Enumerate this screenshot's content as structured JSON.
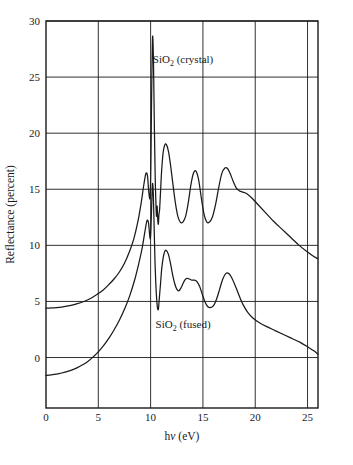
{
  "figure": {
    "background_color": "#ffffff",
    "line_color": "#1a1a1a"
  },
  "axes": {
    "x_title": "hν (eV)",
    "x_title_h": "h",
    "x_title_nu": "ν",
    "x_title_unit": " (eV)",
    "y_title": "Reflectance (percent)",
    "x_tick_labels": [
      "0",
      "5",
      "10",
      "15",
      "20",
      "25"
    ],
    "y_tick_labels": [
      "0",
      "5",
      "10",
      "15",
      "20",
      "25",
      "30"
    ]
  },
  "labels": {
    "crystal_prefix": "SiO",
    "crystal_sub": "2",
    "crystal_suffix": " (crystal)",
    "crystal_full": "SiO2 (crystal)",
    "fused_prefix": "SiO",
    "fused_sub": "2",
    "fused_suffix": " (fused)",
    "fused_full": "SiO2 (fused)"
  },
  "chart_data": {
    "type": "line",
    "title": "",
    "xlabel": "hν (eV)",
    "ylabel": "Reflectance (percent)",
    "xlim": [
      0,
      26
    ],
    "ylim": [
      -4.5,
      30
    ],
    "xticks": [
      0,
      5,
      10,
      15,
      20,
      25
    ],
    "yticks": [
      0,
      5,
      10,
      15,
      20,
      25,
      30
    ],
    "grid": true,
    "legend_position": "inline-annotations",
    "annotations": [
      {
        "text": "SiO2 (crystal)",
        "x": 13.1,
        "y": 26.3
      },
      {
        "text": "SiO2 (fused)",
        "x": 13.1,
        "y": 2.6
      }
    ],
    "series": [
      {
        "name": "SiO2 (crystal)",
        "x": [
          0.0,
          0.5,
          1.0,
          1.5,
          2.0,
          2.5,
          3.0,
          3.5,
          4.0,
          4.5,
          5.0,
          5.5,
          6.0,
          6.5,
          7.0,
          7.5,
          8.0,
          8.4,
          8.8,
          9.1,
          9.35,
          9.55,
          9.7,
          9.8,
          9.9,
          9.96,
          10.02,
          10.08,
          10.14,
          10.2,
          10.28,
          10.36,
          10.44,
          10.5,
          10.56,
          10.62,
          10.68,
          10.74,
          10.8,
          10.86,
          10.95,
          11.05,
          11.2,
          11.35,
          11.5,
          11.7,
          11.9,
          12.1,
          12.35,
          12.6,
          12.85,
          13.1,
          13.35,
          13.6,
          13.85,
          14.1,
          14.35,
          14.6,
          14.85,
          15.1,
          15.35,
          15.6,
          15.9,
          16.2,
          16.5,
          16.8,
          17.1,
          17.35,
          17.6,
          17.9,
          18.2,
          18.5,
          18.8,
          19.2,
          19.7,
          20.3,
          21.0,
          21.8,
          22.6,
          23.4,
          24.2,
          25.0,
          25.6,
          26.0
        ],
        "y": [
          4.4,
          4.42,
          4.45,
          4.5,
          4.58,
          4.68,
          4.8,
          4.95,
          5.15,
          5.4,
          5.7,
          6.05,
          6.5,
          7.0,
          7.6,
          8.4,
          9.5,
          10.6,
          12.2,
          13.8,
          15.4,
          16.4,
          16.2,
          15.0,
          14.2,
          14.5,
          17.0,
          22.0,
          26.5,
          28.65,
          26.0,
          20.5,
          16.0,
          14.0,
          12.6,
          13.5,
          12.3,
          11.9,
          12.8,
          13.2,
          14.8,
          16.6,
          18.3,
          18.95,
          19.0,
          18.4,
          17.2,
          15.7,
          13.9,
          12.6,
          12.05,
          12.1,
          12.6,
          13.8,
          15.4,
          16.45,
          16.6,
          15.8,
          14.2,
          12.8,
          12.1,
          12.05,
          12.5,
          13.6,
          15.1,
          16.4,
          16.9,
          16.85,
          16.4,
          15.7,
          15.1,
          14.85,
          14.75,
          14.6,
          14.2,
          13.6,
          12.9,
          12.1,
          11.4,
          10.7,
          10.0,
          9.4,
          9.0,
          8.8
        ]
      },
      {
        "name": "SiO2 (fused)",
        "x": [
          0.0,
          0.5,
          1.0,
          1.5,
          2.0,
          2.5,
          3.0,
          3.5,
          4.0,
          4.5,
          5.0,
          5.5,
          6.0,
          6.5,
          7.0,
          7.5,
          8.0,
          8.5,
          8.9,
          9.2,
          9.45,
          9.65,
          9.8,
          9.9,
          9.97,
          10.03,
          10.1,
          10.18,
          10.26,
          10.34,
          10.42,
          10.5,
          10.58,
          10.66,
          10.74,
          10.8,
          10.86,
          10.95,
          11.05,
          11.2,
          11.35,
          11.5,
          11.7,
          11.9,
          12.1,
          12.3,
          12.5,
          12.7,
          12.9,
          13.1,
          13.3,
          13.5,
          13.7,
          13.95,
          14.2,
          14.45,
          14.7,
          14.95,
          15.2,
          15.45,
          15.7,
          16.0,
          16.3,
          16.6,
          16.9,
          17.2,
          17.45,
          17.7,
          18.0,
          18.3,
          18.6,
          18.9,
          19.3,
          19.8,
          20.4,
          21.1,
          21.9,
          22.7,
          23.5,
          24.3,
          25.1,
          25.6,
          26.0
        ],
        "y": [
          -1.6,
          -1.55,
          -1.48,
          -1.38,
          -1.25,
          -1.1,
          -0.9,
          -0.65,
          -0.35,
          0.05,
          0.5,
          1.05,
          1.7,
          2.45,
          3.3,
          4.3,
          5.5,
          7.0,
          8.5,
          9.8,
          11.2,
          12.2,
          12.0,
          11.0,
          10.6,
          11.5,
          13.5,
          15.5,
          14.5,
          11.5,
          8.5,
          6.5,
          5.2,
          4.4,
          4.3,
          4.9,
          5.6,
          6.6,
          7.8,
          8.9,
          9.45,
          9.55,
          9.2,
          8.4,
          7.4,
          6.6,
          6.1,
          5.95,
          6.2,
          6.6,
          6.95,
          7.05,
          7.0,
          6.9,
          6.9,
          6.75,
          6.3,
          5.6,
          4.95,
          4.55,
          4.45,
          4.6,
          5.2,
          6.1,
          7.0,
          7.5,
          7.5,
          7.2,
          6.6,
          5.9,
          5.2,
          4.6,
          4.0,
          3.5,
          3.1,
          2.75,
          2.4,
          2.05,
          1.7,
          1.35,
          0.9,
          0.6,
          0.3
        ]
      }
    ]
  },
  "plot_geometry": {
    "left": 46,
    "right": 318,
    "top": 21,
    "bottom": 408
  }
}
